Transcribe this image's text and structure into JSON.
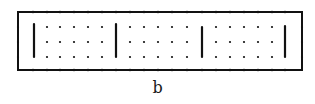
{
  "figure": {
    "caption": "b",
    "frame": {
      "x": 18,
      "y": 12,
      "width": 284,
      "height": 58,
      "stroke": "#111111"
    },
    "bars": [
      {
        "x": 34,
        "y1": 24,
        "y2": 57
      },
      {
        "x": 116,
        "y1": 24,
        "y2": 57
      },
      {
        "x": 202,
        "y1": 27,
        "y2": 57
      },
      {
        "x": 285,
        "y1": 26,
        "y2": 57
      }
    ],
    "dot_rows_y": [
      27,
      42,
      57
    ],
    "dot_columns_x": [
      47,
      60,
      74,
      88,
      102,
      130,
      144,
      158,
      172,
      187,
      216,
      230,
      244,
      258,
      272
    ],
    "edge_ticks_x": [
      33,
      47,
      60,
      74,
      88,
      102,
      116,
      130,
      144,
      158,
      172,
      187,
      202,
      216,
      230,
      244,
      258,
      272,
      285
    ],
    "colors": {
      "ink": "#111111",
      "background": "#ffffff"
    }
  }
}
